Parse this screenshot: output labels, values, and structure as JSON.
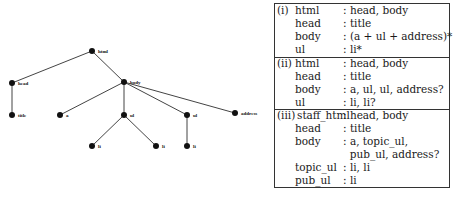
{
  "tree": {
    "nodes": [
      {
        "id": "html",
        "label": "html",
        "x": 92,
        "y": 51
      },
      {
        "id": "head",
        "label": "head",
        "x": 12,
        "y": 83
      },
      {
        "id": "body",
        "label": "body",
        "x": 124,
        "y": 82
      },
      {
        "id": "title",
        "label": "title",
        "x": 12,
        "y": 115
      },
      {
        "id": "a",
        "label": "a",
        "x": 60,
        "y": 115
      },
      {
        "id": "ul1",
        "label": "ul",
        "x": 124,
        "y": 115
      },
      {
        "id": "ul2",
        "label": "ul",
        "x": 187,
        "y": 115
      },
      {
        "id": "address",
        "label": "address",
        "x": 235,
        "y": 113
      },
      {
        "id": "li1",
        "label": "li",
        "x": 92,
        "y": 146
      },
      {
        "id": "li2",
        "label": "li",
        "x": 156,
        "y": 146
      },
      {
        "id": "li3",
        "label": "li",
        "x": 187,
        "y": 146
      }
    ],
    "edges": [
      [
        "html",
        "head"
      ],
      [
        "html",
        "body"
      ],
      [
        "head",
        "title"
      ],
      [
        "body",
        "a"
      ],
      [
        "body",
        "ul1"
      ],
      [
        "body",
        "ul2"
      ],
      [
        "body",
        "address"
      ],
      [
        "ul1",
        "li1"
      ],
      [
        "ul1",
        "li2"
      ],
      [
        "ul2",
        "li3"
      ]
    ]
  },
  "grammar": {
    "sections": [
      {
        "num": "(i)",
        "rules": [
          {
            "lhs": "html",
            "rhs": ": head, body"
          },
          {
            "lhs": "head",
            "rhs": ": title"
          },
          {
            "lhs": "body",
            "rhs": ": (a + ul + address)*"
          },
          {
            "lhs": "ul",
            "rhs": ": li*"
          }
        ]
      },
      {
        "num": "(ii)",
        "rules": [
          {
            "lhs": "html",
            "rhs": ": head, body"
          },
          {
            "lhs": "head",
            "rhs": ": title"
          },
          {
            "lhs": "body",
            "rhs": ": a, ul, ul, address?"
          },
          {
            "lhs": "ul",
            "rhs": ": li, li?"
          }
        ]
      },
      {
        "num": "(iii)",
        "rules": [
          {
            "lhs": "staff_html",
            "rhs": ": head, body"
          },
          {
            "lhs": "head",
            "rhs": ": title"
          },
          {
            "lhs": "body",
            "rhs": ": a, topic_ul,"
          },
          {
            "lhs": "",
            "rhs": "  pub_ul, address?"
          },
          {
            "lhs": "topic_ul",
            "rhs": ": li, li"
          },
          {
            "lhs": "pub_ul",
            "rhs": ": li"
          }
        ]
      }
    ]
  }
}
